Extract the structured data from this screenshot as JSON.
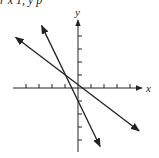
{
  "header": {
    "clipped_text": "r x        1, y     p"
  },
  "chart_data": {
    "type": "line",
    "title": "",
    "xlabel": "x",
    "ylabel": "y",
    "xlim": [
      -4.5,
      4.5
    ],
    "ylim": [
      -4.5,
      4.5
    ],
    "ticks_x": [
      -4,
      -3,
      -2,
      -1,
      1,
      2,
      3,
      4
    ],
    "ticks_y": [
      -4,
      -3,
      -2,
      -1,
      1,
      2,
      3,
      4
    ],
    "grid": false,
    "series": [
      {
        "name": "line-shallow",
        "equation": "y = -2/3 x + 1/3",
        "points": [
          [
            -4.8,
            3.9
          ],
          [
            4.7,
            -3.3
          ]
        ]
      },
      {
        "name": "line-steep",
        "equation": "y = -2x - 1",
        "points": [
          [
            -2.8,
            4.8
          ],
          [
            1.7,
            -4.5
          ]
        ]
      }
    ],
    "intersection": [
      -1,
      1
    ]
  },
  "colors": {
    "ink": "#222222",
    "background": "#ffffff"
  }
}
